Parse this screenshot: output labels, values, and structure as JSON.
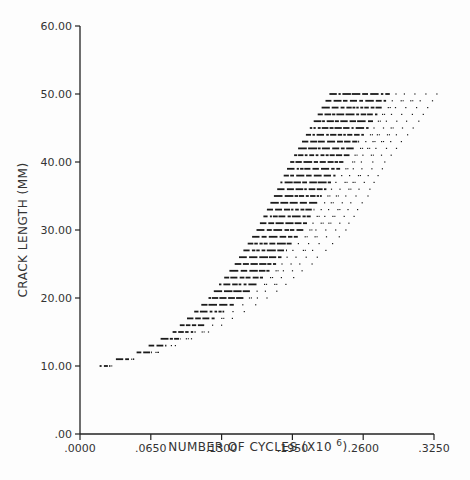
{
  "chart_data": {
    "type": "scatter",
    "title": "",
    "xlabel": "NUMBER OF CYCLES (X10 6)",
    "xlabel_superscript": "6",
    "ylabel": "CRACK LENGTH (MM)",
    "xlim": [
      0.0,
      0.325
    ],
    "ylim": [
      0.0,
      60.0
    ],
    "grid": false,
    "legend": null,
    "x_ticks": [
      ".0000",
      ".0650",
      ".1300",
      ".1950",
      ".2600",
      ".3250"
    ],
    "x_tick_values": [
      0.0,
      0.065,
      0.13,
      0.195,
      0.26,
      0.325
    ],
    "y_ticks": [
      ".00",
      "10.00",
      "20.00",
      "30.00",
      "40.00",
      "50.00",
      "60.00"
    ],
    "y_tick_values": [
      0,
      10,
      20,
      30,
      40,
      50,
      60
    ],
    "crack_length_step_mm": 1.0,
    "bands": [
      {
        "crack_length": 10,
        "cycles_min": 0.018,
        "cycles_dense_max": 0.026,
        "cycles_max": 0.027
      },
      {
        "crack_length": 11,
        "cycles_min": 0.033,
        "cycles_dense_max": 0.045,
        "cycles_max": 0.049
      },
      {
        "crack_length": 12,
        "cycles_min": 0.052,
        "cycles_dense_max": 0.066,
        "cycles_max": 0.072
      },
      {
        "crack_length": 15,
        "cycles_min": 0.085,
        "cycles_dense_max": 0.106,
        "cycles_max": 0.118
      },
      {
        "crack_length": 20,
        "cycles_min": 0.118,
        "cycles_dense_max": 0.15,
        "cycles_max": 0.172
      },
      {
        "crack_length": 25,
        "cycles_min": 0.142,
        "cycles_dense_max": 0.18,
        "cycles_max": 0.212
      },
      {
        "crack_length": 30,
        "cycles_min": 0.162,
        "cycles_dense_max": 0.205,
        "cycles_max": 0.243
      },
      {
        "crack_length": 35,
        "cycles_min": 0.178,
        "cycles_dense_max": 0.222,
        "cycles_max": 0.263
      },
      {
        "crack_length": 40,
        "cycles_min": 0.193,
        "cycles_dense_max": 0.243,
        "cycles_max": 0.28
      },
      {
        "crack_length": 45,
        "cycles_min": 0.211,
        "cycles_dense_max": 0.265,
        "cycles_max": 0.305
      },
      {
        "crack_length": 50,
        "cycles_min": 0.229,
        "cycles_dense_max": 0.285,
        "cycles_max": 0.328
      }
    ],
    "colors": {
      "ink": "#1a1a1a",
      "axis": "#222222",
      "background": "#fdfdfd"
    }
  }
}
